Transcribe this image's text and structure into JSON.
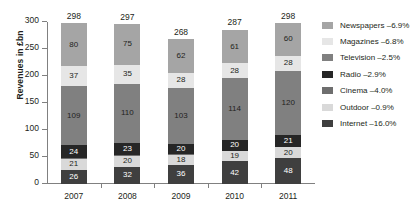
{
  "chart_data": {
    "type": "bar",
    "stacked": true,
    "title": "",
    "xlabel": "",
    "ylabel": "Revenues in £bn",
    "ylim": [
      0,
      300
    ],
    "yticks": [
      0,
      50,
      100,
      150,
      200,
      250,
      300
    ],
    "ytick_labels": [
      "0",
      "50",
      "100",
      "150",
      "200",
      "250",
      "300"
    ],
    "grid": false,
    "legend_position": "right",
    "categories": [
      "2007",
      "2008",
      "2009",
      "2010",
      "2011"
    ],
    "totals": [
      298,
      297,
      268,
      287,
      298
    ],
    "series": [
      {
        "name": "Newspapers",
        "legend_label": "Newspapers –6.9%",
        "change": "–6.9%",
        "color": "#a5a5a5",
        "text_color": "#231f20",
        "values": [
          80,
          75,
          62,
          61,
          60
        ]
      },
      {
        "name": "Magazines",
        "legend_label": "Magazines –6.8%",
        "change": "–6.8%",
        "color": "#e6e6e6",
        "text_color": "#231f20",
        "values": [
          37,
          35,
          28,
          28,
          28
        ]
      },
      {
        "name": "Television",
        "legend_label": "Television –2.5%",
        "change": "–2.5%",
        "color": "#808080",
        "text_color": "#231f20",
        "values": [
          109,
          110,
          103,
          114,
          120
        ]
      },
      {
        "name": "Radio",
        "legend_label": "Radio –2.9%",
        "change": "–2.9%",
        "color": "#262626",
        "text_color": "#ffffff",
        "values": [
          24,
          23,
          20,
          20,
          21
        ]
      },
      {
        "name": "Cinema",
        "legend_label": "Cinema –4.0%",
        "change": "–4.0%",
        "color": "#6e6e6e",
        "text_color": "#ffffff",
        "values": [
          1,
          1,
          1,
          1,
          1
        ],
        "labels_hidden": true
      },
      {
        "name": "Outdoor",
        "legend_label": "Outdoor –0.9%",
        "change": "–0.9%",
        "color": "#d9d9d9",
        "text_color": "#231f20",
        "values": [
          21,
          20,
          18,
          19,
          20
        ]
      },
      {
        "name": "Internet",
        "legend_label": "Internet –16.0%",
        "change": "–16.0%",
        "color": "#3f3f3f",
        "text_color": "#ffffff",
        "values": [
          26,
          32,
          36,
          42,
          48
        ]
      }
    ]
  }
}
